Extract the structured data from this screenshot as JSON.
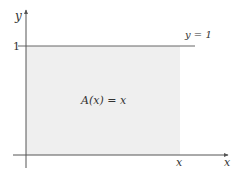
{
  "diagram": {
    "axes": {
      "x_label": "x",
      "y_label": "y",
      "y_tick_label": "1",
      "x_tick_label": "x"
    },
    "line_label": "y = 1",
    "region_label": "A(x) = x",
    "colors": {
      "region_fill": "#efefef",
      "axis": "#555555",
      "line": "#666666",
      "text": "#333333"
    }
  }
}
